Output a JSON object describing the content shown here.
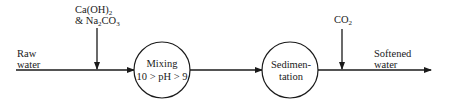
{
  "diagram": {
    "inputs": {
      "raw_water": {
        "line1": "Raw",
        "line2": "water"
      },
      "chemicals": {
        "line1_main": "Ca(OH)",
        "line1_sub": "2",
        "line2_prefix": "& Na",
        "line2_sub1": "2",
        "line2_mid": "CO",
        "line2_sub2": "3"
      },
      "co2": {
        "main": "CO",
        "sub": "2"
      }
    },
    "nodes": [
      {
        "id": "mixing",
        "line1": "Mixing",
        "line2": "10 > pH > 9"
      },
      {
        "id": "sedimentation",
        "line1": "Sedimen-",
        "line2": "tation"
      }
    ],
    "outputs": {
      "softened_water": {
        "line1": "Softened",
        "line2": "water"
      }
    },
    "colors": {
      "stroke": "#1a1a1a",
      "background": "#ffffff"
    }
  }
}
